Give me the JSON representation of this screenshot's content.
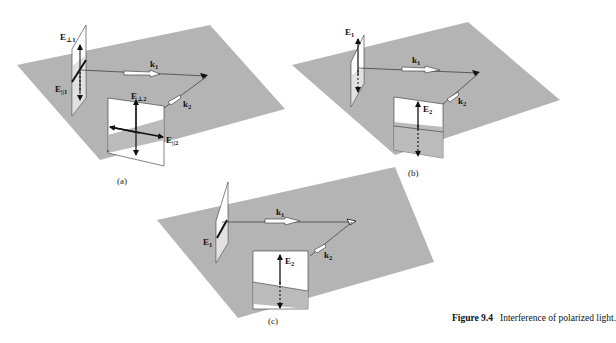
{
  "figure": {
    "number_label": "Figure 9.4",
    "caption_text": "Interference of polarized light."
  },
  "panels": [
    {
      "id": "a",
      "label": "(a)",
      "k1": "k",
      "k1_sub": "1",
      "k2": "k",
      "k2_sub": "2",
      "e_perp1": "E",
      "e_perp1_sub": "⊥1",
      "e_par1": "E",
      "e_par1_sub": "||1",
      "e_perp2": "E",
      "e_perp2_sub": "⊥2",
      "e_par2": "E",
      "e_par2_sub": "||2"
    },
    {
      "id": "b",
      "label": "(b)",
      "k1": "k",
      "k1_sub": "1",
      "k2": "k",
      "k2_sub": "2",
      "e1": "E",
      "e1_sub": "1",
      "e2": "E",
      "e2_sub": "2"
    },
    {
      "id": "c",
      "label": "(c)",
      "k1": "k",
      "k1_sub": "1",
      "k2": "k",
      "k2_sub": "2",
      "e1": "E",
      "e1_sub": "1",
      "e2": "E",
      "e2_sub": "2"
    }
  ],
  "colors": {
    "plane": "#b4b4b4",
    "window": "#ffffff",
    "lines": "#222222"
  }
}
